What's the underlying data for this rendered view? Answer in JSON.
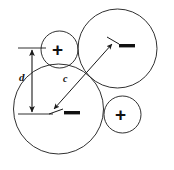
{
  "figure": {
    "background_color": "#ffffff",
    "stroke_color": "#1a1a1a",
    "text_color": "#111111",
    "width": 174,
    "height": 170,
    "circles": [
      {
        "id": "large-circle-lower-left",
        "role": "negative-charge-large",
        "sign": "−",
        "cx": 58.5,
        "cy": 109,
        "r": 45,
        "stroke_width": 0.9
      },
      {
        "id": "large-circle-upper-right",
        "role": "negative-charge-large",
        "sign": "−",
        "cx": 117.5,
        "cy": 48.5,
        "r": 39.5,
        "stroke_width": 0.9
      },
      {
        "id": "small-circle-upper-left",
        "role": "positive-charge-small",
        "sign": "+",
        "cx": 59.5,
        "cy": 49.5,
        "r": 18.5,
        "stroke_width": 0.9
      },
      {
        "id": "small-circle-lower-right",
        "role": "positive-charge-small",
        "sign": "+",
        "cx": 122.5,
        "cy": 114.5,
        "r": 18.5,
        "stroke_width": 0.9
      }
    ],
    "signs": [
      {
        "id": "plus-top-left",
        "symbol": "+",
        "x": 59.5,
        "y": 49.5
      },
      {
        "id": "plus-bottom-right",
        "symbol": "+",
        "x": 122.5,
        "y": 114.5
      },
      {
        "id": "minus-lower-left",
        "symbol": "−",
        "x": 72,
        "y": 114
      },
      {
        "id": "minus-upper-right",
        "symbol": "−",
        "x": 127,
        "y": 47
      }
    ],
    "labels": [
      {
        "id": "label-d",
        "text": "d",
        "style": "italic-bold",
        "x": 19,
        "y": 77
      },
      {
        "id": "label-c",
        "text": "c",
        "style": "italic-bold",
        "x": 63,
        "y": 79
      }
    ],
    "dimension_d": {
      "label": "d",
      "measures": "vertical separation between circle centers",
      "line_x": 32,
      "top_y": 48,
      "bottom_y": 114,
      "top_tick": {
        "x1": 18,
        "x2": 46,
        "y": 48
      },
      "bottom_tick": {
        "x1": 18,
        "x2": 53,
        "y": 114
      },
      "arrowheads": [
        "up",
        "down"
      ]
    },
    "dimension_c": {
      "label": "c",
      "measures": "center-to-center distance between the two large circles",
      "x1": 53,
      "y1": 110,
      "x2": 113,
      "y2": 43,
      "arrowheads": [
        "both"
      ],
      "end_ticks": [
        {
          "id": "tick-lower-left",
          "x1": 50,
          "y1": 114,
          "x2": 64,
          "y2": 110
        },
        {
          "id": "tick-upper-right",
          "x1": 108,
          "y1": 38,
          "x2": 120,
          "y2": 44
        }
      ]
    }
  }
}
